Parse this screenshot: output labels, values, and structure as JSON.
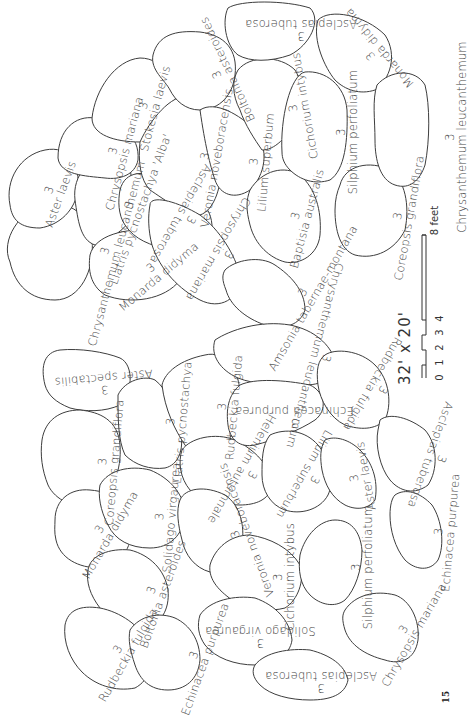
{
  "diagram": {
    "dimensions_label": "32' x 20'",
    "scale_bar": {
      "ticks": [
        "0",
        "1",
        "2",
        "3",
        "4",
        "8"
      ],
      "unit_label": "8 feet"
    },
    "page_number": "15",
    "upper_bed": [
      {
        "qty": "3",
        "name": "Chrysanthemum leucanthemum"
      },
      {
        "qty": "3",
        "name": "Aster laevis"
      },
      {
        "qty": "3",
        "name": "Liatris pycnostachya 'Alba'"
      },
      {
        "qty": "3",
        "name": "Monarda didyma"
      },
      {
        "qty": "3",
        "name": "Chrysopsis mariana"
      },
      {
        "qty": "3",
        "name": "Asclepias tuberosa"
      },
      {
        "qty": "3",
        "name": "Stokesia laevis"
      },
      {
        "qty": "3",
        "name": "Veronia noveboracensis"
      },
      {
        "qty": "3",
        "name": "Boltonia asteroides"
      },
      {
        "qty": "3",
        "name": "Chrysopsis mariana"
      },
      {
        "qty": "3",
        "name": "Lilium superbum"
      },
      {
        "qty": "3",
        "name": "Cichorium intybus"
      },
      {
        "qty": "3",
        "name": "Asclepias tuberosa"
      },
      {
        "qty": "3",
        "name": "Baptisia australis"
      },
      {
        "qty": "3",
        "name": "Silphium perfoliatum"
      },
      {
        "qty": "3",
        "name": "Monarda didyma"
      },
      {
        "qty": "3",
        "name": "Amsonia tabernae-montana"
      },
      {
        "qty": "3",
        "name": "Coreopsis grandiflora"
      },
      {
        "qty": "3",
        "name": "Chrysanthemum leucanthemum"
      }
    ],
    "lower_bed": [
      {
        "qty": "3",
        "name": "Aster spectabilis"
      },
      {
        "qty": "3",
        "name": "Coreopsis grandiflora"
      },
      {
        "qty": "3",
        "name": "Liatris pycnostachya"
      },
      {
        "qty": "3",
        "name": "Rudbeckia fulgida"
      },
      {
        "qty": "3",
        "name": "Chrysanthemum leucanthemum"
      },
      {
        "qty": "3",
        "name": "Monarda didyma"
      },
      {
        "qty": "3",
        "name": "Solidago virgaurea"
      },
      {
        "qty": "3",
        "name": "Helenium autumnale"
      },
      {
        "qty": "3",
        "name": "Echinacea purpurea"
      },
      {
        "qty": "3",
        "name": "Rudbeckia fulgida"
      },
      {
        "qty": "3",
        "name": "Aster spectabilis"
      },
      {
        "qty": "3",
        "name": "Veronia noveboracensis"
      },
      {
        "qty": "3",
        "name": "Lilium superbum"
      },
      {
        "qty": "3",
        "name": "Aster laevis"
      },
      {
        "qty": "3",
        "name": "Asclepias tuberosa"
      },
      {
        "qty": "3",
        "name": "Boltonia asteroides"
      },
      {
        "qty": "3",
        "name": "Cichorium intybus"
      },
      {
        "qty": "3",
        "name": "Silphium perfoliatum"
      },
      {
        "qty": "3",
        "name": "Echinacea purpurea"
      },
      {
        "qty": "3",
        "name": "Rudbeckia fulgida"
      },
      {
        "qty": "3",
        "name": "Echinacea purpurea"
      },
      {
        "qty": "3",
        "name": "Solidago virgaurea"
      },
      {
        "qty": "3",
        "name": "Chrysopsis mariana"
      },
      {
        "qty": "3",
        "name": "Asclepias tuberosa"
      }
    ]
  }
}
